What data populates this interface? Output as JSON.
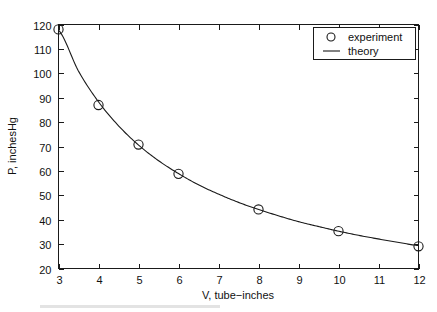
{
  "chart_data": {
    "type": "scatter",
    "title": "",
    "xlabel": "V, tube−inches",
    "ylabel": "P, inchesHg",
    "xlim": [
      3,
      12
    ],
    "ylim": [
      20,
      120
    ],
    "xticks": [
      3,
      4,
      5,
      6,
      7,
      8,
      9,
      10,
      11,
      12
    ],
    "xticklabels": [
      "3",
      "4",
      "5",
      "6",
      "7",
      "8",
      "9",
      "10",
      "11",
      "12"
    ],
    "yticks": [
      20,
      30,
      40,
      50,
      60,
      70,
      80,
      90,
      100,
      110,
      120
    ],
    "yticklabels": [
      "20",
      "30",
      "40",
      "50",
      "60",
      "70",
      "80",
      "90",
      "100",
      "110",
      "120"
    ],
    "grid": false,
    "legend_position": "upper right",
    "series": [
      {
        "name": "experiment",
        "marker": "circle",
        "linestyle": "none",
        "color": "#1a1a1a",
        "x": [
          3,
          4,
          5,
          6,
          8,
          10,
          12
        ],
        "values": [
          118,
          87,
          70.8,
          58.8,
          44.2,
          35.3,
          29.1
        ]
      },
      {
        "name": "theory",
        "marker": "none",
        "linestyle": "solid",
        "color": "#1a1a1a",
        "description": "P = 353.2 / V",
        "x": [
          3,
          3.5,
          4,
          4.5,
          5,
          5.5,
          6,
          6.5,
          7,
          7.5,
          8,
          8.5,
          9,
          9.5,
          10,
          10.5,
          11,
          11.5,
          12
        ],
        "values": [
          117.7,
          100.9,
          88.3,
          78.5,
          70.6,
          64.2,
          58.9,
          54.3,
          50.5,
          47.1,
          44.2,
          41.6,
          39.2,
          37.2,
          35.3,
          33.6,
          32.1,
          30.7,
          29.4
        ]
      }
    ]
  },
  "legend": {
    "entries": [
      {
        "label": "experiment",
        "symbol": "circle-marker"
      },
      {
        "label": "theory",
        "symbol": "line-sample"
      }
    ]
  }
}
